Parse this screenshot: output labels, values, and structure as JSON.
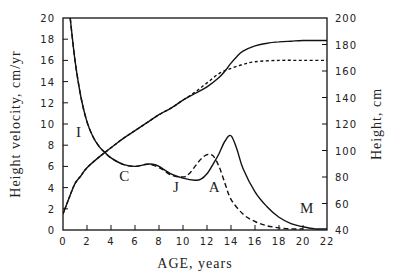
{
  "chart_data": {
    "type": "line",
    "title": "",
    "xlabel": "AGE, years",
    "ylabel_left": "Height velocity, cm/yr",
    "ylabel_right": "Height, cm",
    "xlim": [
      0,
      22
    ],
    "ylim_left": [
      0,
      20
    ],
    "ylim_right": [
      40,
      200
    ],
    "x_ticks": [
      0,
      2,
      4,
      6,
      8,
      10,
      12,
      14,
      16,
      18,
      20,
      22
    ],
    "y_left_ticks": [
      0,
      2,
      4,
      6,
      8,
      10,
      12,
      14,
      16,
      18,
      20
    ],
    "y_right_ticks": [
      40,
      60,
      80,
      100,
      120,
      140,
      160,
      180,
      200
    ],
    "grid": false,
    "legend": null,
    "annotations": [
      {
        "text": "I",
        "x": 1.3,
        "y": 8.8
      },
      {
        "text": "C",
        "x": 5.1,
        "y": 4.6
      },
      {
        "text": "J",
        "x": 9.4,
        "y": 3.6
      },
      {
        "text": "A",
        "x": 12.6,
        "y": 3.6
      },
      {
        "text": "M",
        "x": 20.3,
        "y": 1.6
      }
    ],
    "series": [
      {
        "name": "Height velocity (male)",
        "axis": "left",
        "style": "solid",
        "x": [
          0.6,
          1,
          1.5,
          2,
          2.5,
          3,
          3.5,
          4,
          5,
          6,
          7,
          7.5,
          8,
          9,
          10,
          11,
          11.5,
          12,
          12.5,
          13,
          13.5,
          14,
          14.5,
          15,
          16,
          17,
          18,
          19,
          20,
          21,
          22
        ],
        "values": [
          20,
          16,
          12.5,
          10.2,
          8.8,
          7.9,
          7.3,
          6.8,
          6.2,
          6.0,
          6.2,
          6.2,
          6.0,
          5.3,
          4.9,
          4.7,
          4.8,
          5.3,
          6.2,
          7.2,
          8.4,
          8.9,
          7.6,
          5.8,
          3.6,
          2.2,
          1.2,
          0.6,
          0.3,
          0.1,
          0.1
        ]
      },
      {
        "name": "Height velocity (female)",
        "axis": "left",
        "style": "dashed",
        "x": [
          0.6,
          1,
          1.5,
          2,
          2.5,
          3,
          3.5,
          4,
          5,
          6,
          7,
          8,
          9,
          10,
          10.5,
          11,
          11.5,
          12,
          12.5,
          13,
          13.5,
          14,
          15,
          16,
          17,
          18,
          19,
          20
        ],
        "values": [
          20,
          16,
          12.5,
          10.2,
          8.8,
          7.9,
          7.3,
          6.8,
          6.2,
          6.0,
          6.2,
          5.9,
          5.2,
          5.0,
          5.3,
          6.0,
          6.7,
          7.1,
          7.0,
          6.0,
          4.4,
          2.9,
          1.5,
          0.8,
          0.4,
          0.2,
          0.1,
          0.1
        ]
      },
      {
        "name": "Height (male)",
        "axis": "right",
        "style": "solid",
        "x": [
          0,
          0.5,
          1,
          1.5,
          2,
          3,
          4,
          5,
          6,
          7,
          8,
          9,
          10,
          11,
          12,
          13,
          13.5,
          14,
          14.5,
          15,
          16,
          17,
          18,
          19,
          20,
          22
        ],
        "values": [
          52,
          64,
          75,
          81,
          87,
          95,
          102,
          109,
          115,
          121,
          127,
          132,
          138,
          143,
          148,
          155,
          160,
          166,
          171,
          175,
          179,
          181,
          182,
          182.5,
          183,
          183
        ]
      },
      {
        "name": "Height (female)",
        "axis": "right",
        "style": "dotted",
        "x": [
          0,
          0.5,
          1,
          1.5,
          2,
          3,
          4,
          5,
          6,
          7,
          8,
          9,
          10,
          11,
          12,
          13,
          14,
          15,
          16,
          18,
          20,
          22
        ],
        "values": [
          52,
          64,
          75,
          81,
          87,
          95,
          102,
          109,
          115,
          121,
          127,
          132,
          138,
          144,
          151,
          158,
          162,
          165,
          167,
          168,
          168,
          168
        ]
      }
    ]
  }
}
